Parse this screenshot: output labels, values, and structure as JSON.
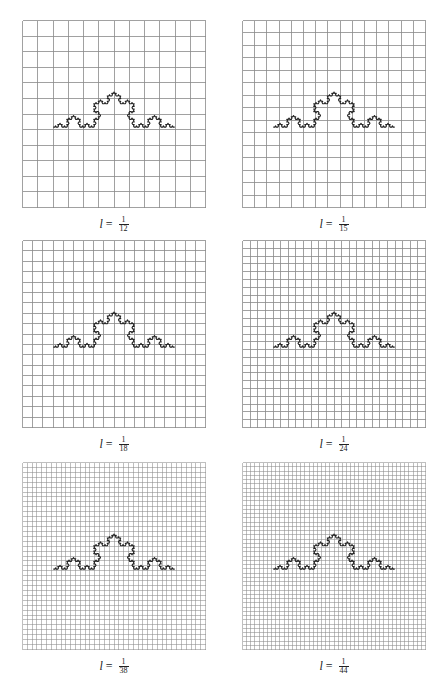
{
  "figure": {
    "panels": [
      {
        "label_var": "l",
        "label_eq": "=",
        "numerator": "1",
        "denominator": "12",
        "grid_divisions": 12,
        "x": 22,
        "y": 20
      },
      {
        "label_var": "l",
        "label_eq": "=",
        "numerator": "1",
        "denominator": "15",
        "grid_divisions": 15,
        "x": 242,
        "y": 20
      },
      {
        "label_var": "l",
        "label_eq": "=",
        "numerator": "1",
        "denominator": "18",
        "grid_divisions": 18,
        "x": 22,
        "y": 240
      },
      {
        "label_var": "l",
        "label_eq": "=",
        "numerator": "1",
        "denominator": "24",
        "grid_divisions": 24,
        "x": 242,
        "y": 240
      },
      {
        "label_var": "l",
        "label_eq": "=",
        "numerator": "1",
        "denominator": "38",
        "grid_divisions": 38,
        "x": 22,
        "y": 462
      },
      {
        "label_var": "l",
        "label_eq": "=",
        "numerator": "1",
        "denominator": "44",
        "grid_divisions": 44,
        "x": 242,
        "y": 462
      }
    ],
    "colors": {
      "grid_line": "#8a8a8a",
      "curve": "#222222",
      "background": "#ffffff"
    },
    "curve": {
      "type": "koch",
      "iterations": 4,
      "start": [
        0.17,
        0.57
      ],
      "end": [
        0.83,
        0.57
      ]
    }
  }
}
